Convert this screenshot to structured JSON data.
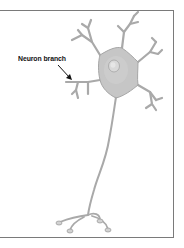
{
  "figure": {
    "subject": "neuron",
    "annotation": {
      "label": "Neuron branch",
      "target": "dendrite"
    },
    "colors": {
      "cell_body": "#c8c8c8",
      "cell_outline": "#a8a8a8",
      "nucleus": "#d8d8d8",
      "frame": "#7a7a7a",
      "label_text": "#111111",
      "arrow": "#111111"
    }
  }
}
